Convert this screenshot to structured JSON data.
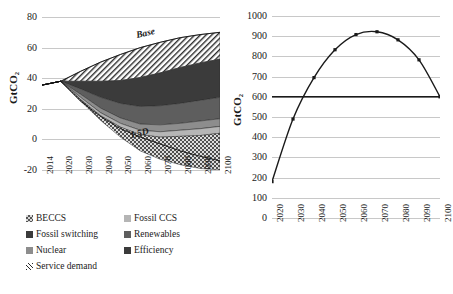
{
  "chart_data": [
    {
      "id": "left",
      "type": "area",
      "title": "",
      "xlabel": "",
      "ylabel": "GtCO2",
      "ylabel_display": "GtCO₂",
      "ylim": [
        -20,
        80
      ],
      "yticks": [
        -20,
        0,
        20,
        40,
        60,
        80
      ],
      "grid": true,
      "legend_position": "below",
      "x": [
        2014,
        2020,
        2030,
        2040,
        2050,
        2060,
        2070,
        2080,
        2090,
        2100
      ],
      "xtick_labels": [
        "2014",
        "2020",
        "2030",
        "2040",
        "2050",
        "2060",
        "2070",
        "2080",
        "2090",
        "2100"
      ],
      "annotations": [
        {
          "text": "Base",
          "x": 2065,
          "y": 66
        },
        {
          "text": "1.5D",
          "x": 2062,
          "y": 1
        }
      ],
      "baseline_series": {
        "name": "Base",
        "values": [
          35.5,
          38.0,
          44.5,
          50.5,
          55.5,
          60.0,
          63.5,
          66.5,
          68.5,
          70.0
        ]
      },
      "pathway_series": {
        "name": "1.5D",
        "values": [
          35.5,
          38.0,
          25.0,
          15.0,
          7.0,
          1.5,
          -3.0,
          -7.5,
          -11.0,
          -14.0
        ]
      },
      "series": [
        {
          "name": "Efficiency",
          "pattern": "hatch",
          "values": [
            0,
            0,
            6.5,
            12.5,
            17.0,
            19.5,
            20.0,
            19.5,
            18.5,
            17.5
          ]
        },
        {
          "name": "Fossil switching",
          "pattern": "dark",
          "values": [
            0,
            0,
            5.0,
            10.5,
            15.0,
            19.0,
            21.5,
            23.5,
            24.5,
            25.0
          ]
        },
        {
          "name": "Renewables",
          "pattern": "mid",
          "values": [
            0,
            0,
            3.5,
            7.0,
            9.5,
            11.5,
            12.5,
            13.0,
            13.5,
            14.0
          ]
        },
        {
          "name": "Nuclear",
          "pattern": "grey",
          "values": [
            0,
            0,
            2.0,
            3.0,
            3.5,
            4.0,
            4.5,
            4.5,
            5.0,
            5.0
          ]
        },
        {
          "name": "Fossil CCS",
          "pattern": "light",
          "values": [
            0,
            0,
            1.5,
            2.0,
            2.5,
            3.0,
            3.5,
            4.0,
            4.5,
            4.5
          ]
        },
        {
          "name": "BECCS",
          "pattern": "check",
          "values": [
            0,
            0,
            1.0,
            3.0,
            6.5,
            10.5,
            14.5,
            18.5,
            21.5,
            24.0
          ]
        }
      ]
    },
    {
      "id": "right",
      "type": "line",
      "title": "",
      "xlabel": "",
      "ylabel": "GtCO2",
      "ylabel_display": "GtCO₂",
      "ylim": [
        0,
        1000
      ],
      "yticks": [
        0,
        100,
        200,
        300,
        400,
        500,
        600,
        700,
        800,
        900,
        1000
      ],
      "grid": true,
      "markers": true,
      "x": [
        2020,
        2030,
        2040,
        2050,
        2060,
        2070,
        2080,
        2090,
        2100
      ],
      "xtick_labels": [
        "2020",
        "2030",
        "2040",
        "2050",
        "2060",
        "2070",
        "2080",
        "2090",
        "2100"
      ],
      "series": [
        {
          "name": "cumulative",
          "values": [
            180,
            490,
            695,
            833,
            908,
            922,
            882,
            783,
            600
          ]
        },
        {
          "name": "budget-line",
          "values": [
            600,
            600,
            600,
            600,
            600,
            600,
            600,
            600,
            600
          ]
        }
      ]
    }
  ],
  "legend": {
    "rows": [
      [
        {
          "label": "BECCS",
          "pattern": "check"
        },
        {
          "label": "Fossil CCS",
          "pattern": "light"
        }
      ],
      [
        {
          "label": "Fossil switching",
          "pattern": "dark"
        },
        {
          "label": "Renewables",
          "pattern": "mid"
        }
      ],
      [
        {
          "label": "Nuclear",
          "pattern": "grey"
        },
        {
          "label": "Efficiency",
          "pattern": "hatch"
        }
      ]
    ],
    "footer": {
      "label": "Service demand",
      "pattern": "hatch"
    }
  },
  "colors": {
    "grid": "#c8c8c8",
    "axis": "#7a7a7a",
    "line": "#1a1a1a",
    "efficiency": "#ffffff",
    "fossil_switching": "#3b3b3b",
    "renewables": "#5e5e5e",
    "nuclear": "#8d8d8d",
    "fossil_ccs": "#b5b5b5",
    "beccs": "#d8d8d8"
  }
}
